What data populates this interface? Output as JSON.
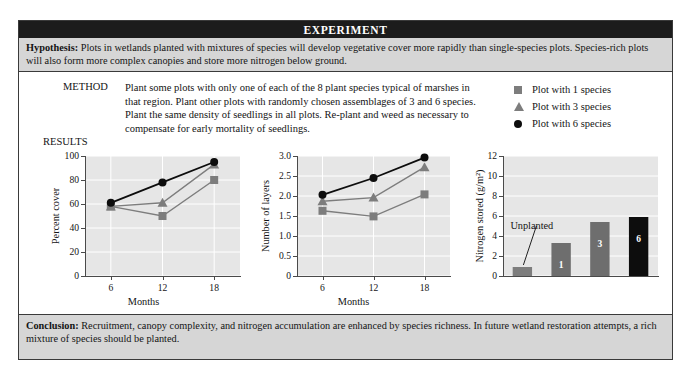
{
  "header": {
    "title": "EXPERIMENT"
  },
  "hypothesis": {
    "label": "Hypothesis:",
    "text": " Plots in wetlands planted with mixtures of species will develop vegetative cover more rapidly than single-species plots. Species-rich plots will also form more complex canopies and store more nitrogen below ground."
  },
  "method": {
    "label": "METHOD",
    "text": "Plant some plots with only one of each of the 8 plant species typical of marshes in that region. Plant other plots with randomly chosen assemblages of 3 and 6 species. Plant the same density of seedlings in all plots. Re-plant and weed as necessary to compensate for early mortality of seedlings."
  },
  "results": {
    "label": "RESULTS"
  },
  "legend": {
    "items": [
      {
        "marker": "square-marker",
        "label": "Plot with 1 species",
        "color": "#7d7d7d"
      },
      {
        "marker": "triangle-marker",
        "label": "Plot with 3 species",
        "color": "#7d7d7d"
      },
      {
        "marker": "circle-marker",
        "label": "Plot with 6 species",
        "color": "#0d0d0d"
      }
    ]
  },
  "conclusion": {
    "label": "Conclusion:",
    "text": " Recruitment, canopy complexity, and nitrogen accumulation are enhanced by species richness. In future wetland restoration attempts, a rich mixture of species should be planted."
  },
  "chart_data": [
    {
      "id": "percent-cover",
      "type": "line",
      "title": "",
      "xlabel": "Months",
      "ylabel": "Percent cover",
      "x": [
        6,
        12,
        18
      ],
      "xticks": [
        "6",
        "12",
        "18"
      ],
      "yticks": [
        "0",
        "20",
        "40",
        "60",
        "80",
        "100"
      ],
      "ylim": [
        0,
        100
      ],
      "grid": true,
      "series": [
        {
          "name": "Plot with 1 species",
          "marker": "square",
          "color": "#7d7d7d",
          "values": [
            58,
            50,
            80
          ]
        },
        {
          "name": "Plot with 3 species",
          "marker": "triangle",
          "color": "#7d7d7d",
          "values": [
            58,
            61,
            93
          ]
        },
        {
          "name": "Plot with 6 species",
          "marker": "circle",
          "color": "#0d0d0d",
          "values": [
            61,
            78,
            95
          ]
        }
      ]
    },
    {
      "id": "number-of-layers",
      "type": "line",
      "title": "",
      "xlabel": "Months",
      "ylabel": "Number of layers",
      "x": [
        6,
        12,
        18
      ],
      "xticks": [
        "6",
        "12",
        "18"
      ],
      "yticks": [
        "0",
        "0.5",
        "1.0",
        "1.5",
        "2.0",
        "2.5",
        "3.0"
      ],
      "ylim": [
        0,
        3.0
      ],
      "grid": true,
      "series": [
        {
          "name": "Plot with 1 species",
          "marker": "square",
          "color": "#7d7d7d",
          "values": [
            1.63,
            1.49,
            2.04
          ]
        },
        {
          "name": "Plot with 3 species",
          "marker": "triangle",
          "color": "#7d7d7d",
          "values": [
            1.87,
            1.96,
            2.72
          ]
        },
        {
          "name": "Plot with 6 species",
          "marker": "circle",
          "color": "#0d0d0d",
          "values": [
            2.03,
            2.45,
            2.96
          ]
        }
      ]
    },
    {
      "id": "nitrogen-stored",
      "type": "bar",
      "title": "",
      "xlabel": "",
      "ylabel": "Nitrogen stored (g/m²)",
      "categories": [
        "Unplanted",
        "1",
        "3",
        "6"
      ],
      "values": [
        0.9,
        3.3,
        5.4,
        5.9
      ],
      "yticks": [
        "0",
        "2",
        "4",
        "6",
        "8",
        "10",
        "12"
      ],
      "ylim": [
        0,
        12
      ],
      "grid": true,
      "bar_labels": [
        "",
        "1",
        "3",
        "6"
      ],
      "bar_colors": [
        "#7d7d7d",
        "#6e6e6e",
        "#6e6e6e",
        "#0d0d0d"
      ],
      "annotation": "Unplanted"
    }
  ]
}
